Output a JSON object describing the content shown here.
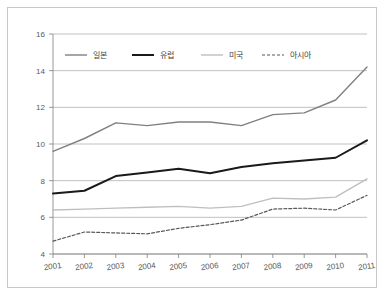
{
  "chart_data": {
    "type": "line",
    "title": "",
    "subtitle": "",
    "xlabel": "",
    "ylabel": "",
    "categories": [
      "2001",
      "2002",
      "2003",
      "2004",
      "2005",
      "2006",
      "2007",
      "2008",
      "2009",
      "2010",
      "2011"
    ],
    "x": [
      2001,
      2002,
      2003,
      2004,
      2005,
      2006,
      2007,
      2008,
      2009,
      2010,
      2011
    ],
    "xlim": [
      2001,
      2011
    ],
    "ylim": [
      4,
      16
    ],
    "yticks": [
      4,
      6,
      8,
      10,
      12,
      14,
      16
    ],
    "ytick_labels": [
      "4",
      "6",
      "8",
      "10",
      "12",
      "14",
      "16"
    ],
    "grid": true,
    "legend_position": "top-inside",
    "series": [
      {
        "name": "일본",
        "color": "#808080",
        "linewidth": 1.4,
        "dash": "none",
        "values": [
          9.6,
          10.3,
          11.15,
          11.0,
          11.2,
          11.2,
          11.0,
          11.6,
          11.7,
          12.4,
          14.2
        ]
      },
      {
        "name": "유럽",
        "color": "#1a1a1a",
        "linewidth": 2.0,
        "dash": "none",
        "values": [
          7.3,
          7.45,
          8.25,
          8.45,
          8.65,
          8.4,
          8.75,
          8.95,
          9.1,
          9.25,
          10.2
        ]
      },
      {
        "name": "미국",
        "color": "#bfbfbf",
        "linewidth": 1.4,
        "dash": "none",
        "values": [
          6.4,
          6.45,
          6.5,
          6.55,
          6.6,
          6.5,
          6.6,
          7.05,
          7.0,
          7.1,
          8.1
        ]
      },
      {
        "name": "아시아",
        "color": "#595959",
        "linewidth": 1.2,
        "dash": "3,2",
        "values": [
          4.7,
          5.2,
          5.15,
          5.1,
          5.4,
          5.6,
          5.85,
          6.45,
          6.5,
          6.4,
          7.2
        ]
      }
    ]
  },
  "legend": {
    "items": [
      {
        "label": "일본"
      },
      {
        "label": "유럽"
      },
      {
        "label": "미국"
      },
      {
        "label": "아시아"
      }
    ]
  }
}
